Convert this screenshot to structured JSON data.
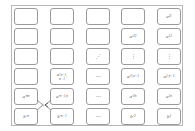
{
  "diagram": {
    "columns": 5,
    "rows": 6,
    "cells": [
      [
        "",
        "",
        "",
        "",
        "a_{11}"
      ],
      [
        "",
        "",
        "",
        "a'_{22}",
        "a_{12}"
      ],
      [
        "",
        "",
        "⋰",
        "⋮",
        "⋮"
      ],
      [
        "",
        "a'_{n-1,n-1}",
        "⋯",
        "a'_{2,n-1}",
        "a_{1,n-1}"
      ],
      [
        "a'_{nn}",
        "a'_{n-1,n}",
        "⋯",
        "a'_{2n}",
        "a_{1n}"
      ],
      [
        "b'_{n}",
        "b'_{n-1}",
        "⋯",
        "b'_{2}",
        "b_{1}"
      ]
    ],
    "labels": {
      "r0c4": "a",
      "r0c4s": "11",
      "r1c3": "a′",
      "r1c3s": "22",
      "r1c4": "a",
      "r1c4s": "12",
      "r2c2": "⋰",
      "r2c3": "⋮",
      "r2c4": "⋮",
      "r3c1": "a′",
      "r3c1s": "n−1,",
      "r3c1s2": "n−1",
      "r3c2": "⋯",
      "r3c3": "a′",
      "r3c3s": "2,n−1",
      "r3c4": "a",
      "r3c4s": "1,n−1",
      "r4c0": "a′",
      "r4c0s": "nn",
      "r4c1": "a′",
      "r4c1s": "n−1,n",
      "r4c2": "⋯",
      "r4c3": "a′",
      "r4c3s": "2n",
      "r4c4": "a",
      "r4c4s": "1n",
      "r5c0": "b′",
      "r5c0s": "n",
      "r5c1": "b′",
      "r5c1s": "n−1",
      "r5c2": "⋯",
      "r5c3": "b′",
      "r5c3s": "2",
      "r5c4": "b",
      "r5c4s": "1"
    },
    "connector": "swap arrow between a'_{nn}/b'_n column and a'_{n-1,n}/b'_{n-1} column",
    "colors": {
      "border": "#9a9a9a",
      "frame": "#b8b8b8",
      "text": "#555555"
    }
  }
}
